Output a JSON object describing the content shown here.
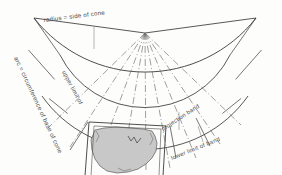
{
  "figure": {
    "type": "cone-projection-development-diagram",
    "title_visible": false,
    "background_color": "#fdfdfc",
    "line_color": "#3a3a3a",
    "band_fill_color": "#c8c8c8",
    "label_color": "#4a4a4a"
  },
  "labels": {
    "radius": "radius = side of cone",
    "arc": "arc = circumference of base of cone",
    "upper_limit": "upper limit of",
    "projection_band": "projection band",
    "lower_limit": "lower limit of band"
  },
  "geometry": {
    "apex_x": 145,
    "apex_y": 33,
    "outer_radius": 140,
    "inner_radius_upper": 92,
    "inner_radius_lower": 124,
    "sector_start_deg": 20,
    "sector_end_deg": 160,
    "radial_divisions": 6,
    "dashdot_rays": 9
  },
  "map": {
    "subject": "united-states-outline",
    "fill": "#c8c8c8",
    "stroke": "#555555"
  }
}
